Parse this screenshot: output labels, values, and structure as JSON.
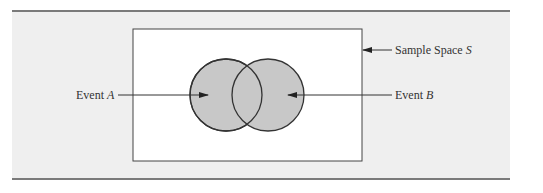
{
  "diagram": {
    "type": "venn",
    "sample_space": {
      "label": "Sample Space ",
      "symbol": "S"
    },
    "event_a": {
      "label": "Event ",
      "symbol": "A"
    },
    "event_b": {
      "label": "Event ",
      "symbol": "B"
    },
    "colors": {
      "panel": "#efefef",
      "rule": "#7a7a7a",
      "box_fill": "#ffffff",
      "circle_fill": "#c8c8c8",
      "stroke": "#333333"
    }
  }
}
